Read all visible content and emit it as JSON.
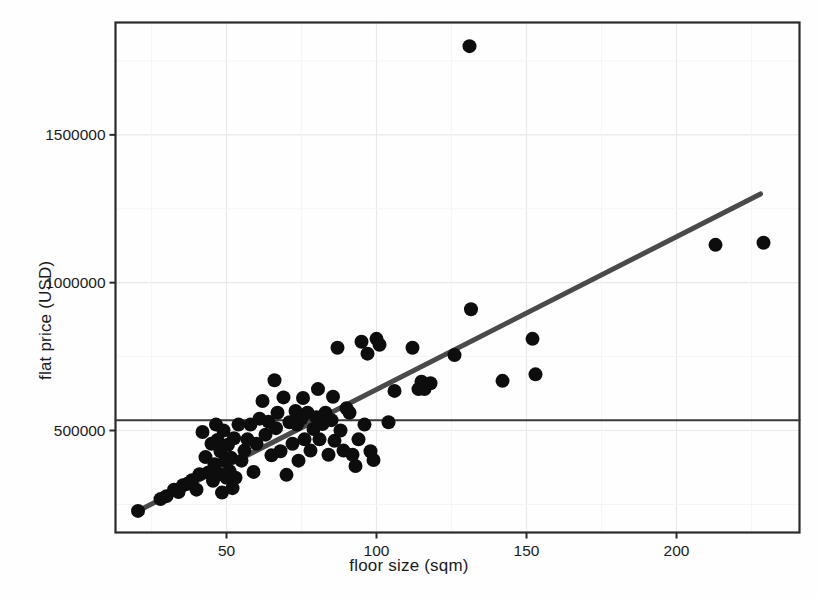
{
  "chart_data": {
    "type": "scatter",
    "title": "",
    "xlabel": "floor size (sqm)",
    "ylabel": "flat price (USD)",
    "xlim": [
      13,
      241
    ],
    "ylim": [
      155000,
      1880000
    ],
    "xticks": [
      50,
      100,
      150,
      200
    ],
    "xtick_labels": [
      "50",
      "100",
      "150",
      "200"
    ],
    "yticks": [
      500000,
      1000000,
      1500000
    ],
    "ytick_labels": [
      "500000",
      "1000000",
      "1500000"
    ],
    "grid": true,
    "legend": null,
    "point_color": "#0d0d0d",
    "point_radius": 7,
    "series": [
      {
        "name": "flats",
        "x": [
          20.5,
          28.0,
          30.0,
          32.5,
          34.0,
          35.5,
          37.0,
          38.5,
          40.0,
          41.0,
          42.0,
          43.0,
          44.0,
          45.0,
          45.5,
          46.0,
          46.5,
          47.0,
          47.5,
          48.0,
          48.5,
          49.0,
          49.5,
          50.0,
          50.5,
          51.0,
          51.5,
          52.0,
          52.5,
          53.0,
          54.0,
          55.0,
          56.0,
          57.0,
          58.0,
          59.0,
          60.0,
          61.0,
          62.0,
          63.0,
          64.0,
          65.0,
          66.0,
          66.5,
          67.0,
          68.0,
          69.0,
          70.0,
          71.0,
          72.0,
          73.0,
          73.5,
          74.0,
          75.0,
          75.5,
          76.0,
          77.0,
          78.0,
          79.0,
          80.0,
          80.5,
          81.0,
          82.0,
          83.0,
          84.0,
          85.0,
          85.5,
          86.0,
          87.0,
          88.0,
          89.0,
          90.0,
          91.0,
          92.0,
          93.0,
          94.0,
          95.0,
          96.0,
          97.0,
          98.0,
          99.0,
          100.0,
          101.0,
          104.0,
          106.0,
          112.0,
          114.0,
          115.0,
          116.0,
          118.0,
          126.0,
          131.0,
          131.5,
          142.0,
          152.0,
          153.0,
          213.0,
          229.0
        ],
        "y": [
          228000,
          268000,
          278000,
          300000,
          292000,
          315000,
          320000,
          332000,
          300000,
          352000,
          495000,
          410000,
          358000,
          455000,
          330000,
          386000,
          520000,
          468000,
          352000,
          430000,
          290000,
          500000,
          398000,
          340000,
          452000,
          362000,
          408000,
          305000,
          474000,
          340000,
          520000,
          398000,
          432000,
          470000,
          520000,
          360000,
          455000,
          540000,
          600000,
          486000,
          530000,
          416000,
          670000,
          508000,
          560000,
          430000,
          612000,
          350000,
          528000,
          455000,
          566000,
          520000,
          398000,
          540000,
          610000,
          470000,
          560000,
          432000,
          505000,
          545000,
          640000,
          470000,
          522000,
          560000,
          418000,
          535000,
          614000,
          465000,
          780000,
          500000,
          432000,
          575000,
          560000,
          418000,
          380000,
          470000,
          800000,
          520000,
          760000,
          430000,
          400000,
          810000,
          790000,
          528000,
          634000,
          780000,
          640000,
          665000,
          640000,
          660000,
          755000,
          1800000,
          910000,
          668000,
          810000,
          690000,
          1128000,
          1135000
        ],
        "color": "#0d0d0d"
      }
    ],
    "lines": [
      {
        "name": "regression-line",
        "x": [
          20.5,
          228.0
        ],
        "y": [
          228000,
          1300000
        ],
        "color": "#4a4a4a",
        "width": 5
      },
      {
        "name": "mean-reference-line",
        "x": [
          13.0,
          241.0
        ],
        "y": [
          535000,
          535000
        ],
        "color": "#3a3a3a",
        "width": 2
      }
    ]
  }
}
